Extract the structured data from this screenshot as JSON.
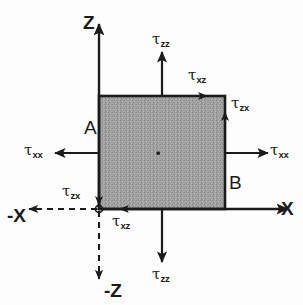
{
  "figure": {
    "background_color": "#fdfdfd",
    "stroke_color": "#1b1b1b",
    "element_fill_color": "#9e9e9e"
  },
  "axes": {
    "z_positive": "Z",
    "x_positive": "X",
    "x_negative": "-X",
    "z_negative": "-Z"
  },
  "corners": {
    "left": "A",
    "right": "B"
  },
  "stresses": {
    "normal_top": {
      "symbol": "τ",
      "sub": "zz"
    },
    "normal_bottom": {
      "symbol": "τ",
      "sub": "zz"
    },
    "normal_left": {
      "symbol": "τ",
      "sub": "xx"
    },
    "normal_right": {
      "symbol": "τ",
      "sub": "xx"
    },
    "shear_top": {
      "symbol": "τ",
      "sub": "xz"
    },
    "shear_bottom": {
      "symbol": "τ",
      "sub": "xz"
    },
    "shear_right": {
      "symbol": "τ",
      "sub": "zx"
    },
    "shear_left": {
      "symbol": "τ",
      "sub": "zx"
    }
  },
  "element": {
    "x": 99,
    "y": 96,
    "width": 126,
    "height": 113,
    "center_x": 158,
    "center_y": 153
  },
  "origin": {
    "x": 99,
    "y": 209
  }
}
